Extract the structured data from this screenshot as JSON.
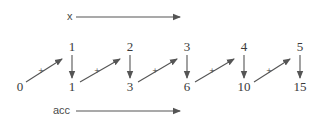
{
  "diagram": {
    "type": "scan / running accumulation",
    "x_label": "x",
    "acc_label": "acc",
    "operator": "+",
    "x_values": [
      "1",
      "2",
      "3",
      "4",
      "5"
    ],
    "acc_values": [
      "0",
      "1",
      "3",
      "6",
      "10",
      "15"
    ],
    "colors": {
      "ink": "#3a3a3a",
      "arrow": "#555555",
      "background": "#ffffff"
    }
  }
}
